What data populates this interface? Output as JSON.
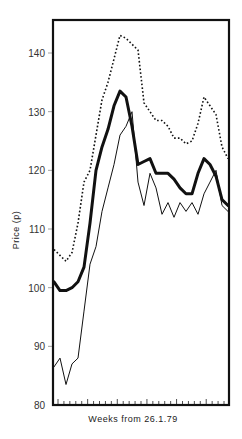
{
  "chart_data": {
    "type": "line",
    "title": "",
    "xlabel": "Weeks from 26.1.79",
    "ylabel": "Price (p)",
    "ylim": [
      80,
      145
    ],
    "yticks": [
      80,
      90,
      100,
      110,
      120,
      130,
      140
    ],
    "x_tick_count": 29,
    "grid": false,
    "legend": null,
    "x": [
      0,
      1,
      2,
      3,
      4,
      5,
      6,
      7,
      8,
      9,
      10,
      11,
      12,
      13,
      14,
      15,
      16,
      17,
      18,
      19,
      20,
      21,
      22,
      23,
      24,
      25,
      26,
      27,
      28,
      29
    ],
    "series": [
      {
        "name": "upper (dotted)",
        "style": "dotted",
        "values": [
          106.5,
          105.5,
          104.5,
          106,
          111,
          118,
          120,
          126,
          132,
          135,
          139,
          143,
          142.5,
          141.5,
          140.5,
          131.5,
          130,
          128.5,
          128.5,
          127.5,
          125.5,
          125.5,
          124.5,
          125,
          128,
          132.5,
          131,
          129.5,
          124,
          122
        ]
      },
      {
        "name": "middle (thick)",
        "style": "thick",
        "values": [
          101,
          99.5,
          99.5,
          100,
          101,
          103.5,
          111,
          120,
          124,
          127,
          131,
          133.5,
          132.5,
          127.5,
          121,
          121.5,
          122,
          119.5,
          119.5,
          119.5,
          118.5,
          117,
          116,
          116,
          119.5,
          122,
          121,
          119,
          115,
          114
        ]
      },
      {
        "name": "lower (thin)",
        "style": "thin",
        "values": [
          86.5,
          88,
          83.5,
          87,
          88,
          96,
          104,
          107,
          113,
          117,
          121,
          126,
          127.5,
          130,
          118,
          114,
          119.5,
          117,
          112.5,
          114.5,
          112,
          114.5,
          113,
          114.5,
          112.5,
          116,
          118,
          120,
          114,
          113
        ]
      }
    ]
  },
  "axes": {
    "y_ticks": [
      "80",
      "90",
      "100",
      "110",
      "120",
      "130",
      "140"
    ],
    "y_label": "Price (p)",
    "x_label": "Weeks from 26.1.79"
  }
}
